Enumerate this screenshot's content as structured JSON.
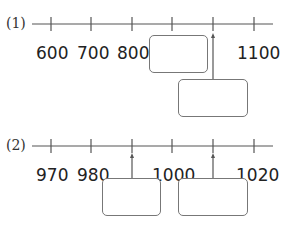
{
  "problems": [
    {
      "label": "(1)",
      "ticks": [
        "600",
        "700",
        "800",
        "",
        "",
        "1100"
      ],
      "answer_boxes": 2
    },
    {
      "label": "(2)",
      "ticks": [
        "970",
        "980",
        "",
        "1000",
        "",
        "1020"
      ],
      "answer_boxes": 2
    }
  ]
}
